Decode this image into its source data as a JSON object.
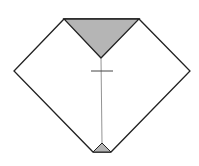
{
  "diagram": {
    "title": "",
    "colors": {
      "stroke": "#222222",
      "fill_shaded": "#b5b5b5",
      "background": "#ffffff",
      "crease": "#777777"
    },
    "shapes": {
      "outline": "64,19 139,19 190,71 111,152 93,152 14,71",
      "top_triangle": "64,19 139,19 101,58",
      "bottom_triangle": "93,152 111,152 102,143",
      "center_line": {
        "x1": 101,
        "y1": 58,
        "x2": 102,
        "y2": 143
      },
      "cross_mark": {
        "x1": 91,
        "y1": 71,
        "x2": 113,
        "y2": 71
      }
    }
  }
}
